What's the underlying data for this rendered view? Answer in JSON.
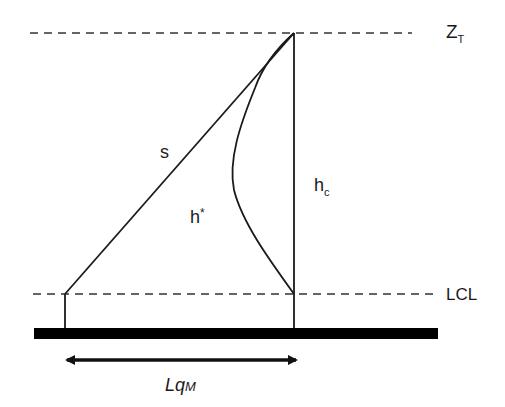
{
  "diagram": {
    "levels": {
      "top": {
        "label_main": "Z",
        "label_sub": "T",
        "y": 33
      },
      "lcl": {
        "label": "LCL",
        "y": 294
      }
    },
    "lines": {
      "slant": {
        "label": "s"
      },
      "vertical": {
        "label_main": "h",
        "label_sub": "c"
      },
      "curve": {
        "label_main": "h",
        "label_sup": "*"
      }
    },
    "ground": {
      "color": "#000000"
    },
    "arrow": {
      "label_main": "Lq",
      "label_small": "M"
    },
    "colors": {
      "line": "#1a1a1a",
      "dashed": "#333333",
      "ground": "#000000",
      "background": "#ffffff"
    }
  }
}
